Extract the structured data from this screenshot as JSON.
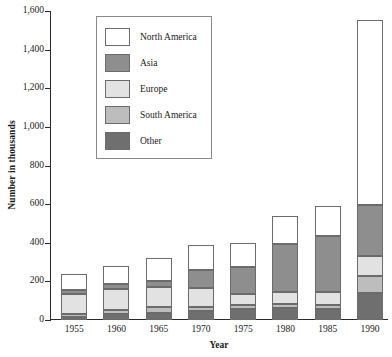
{
  "chart_data": {
    "type": "bar",
    "stacked": true,
    "title": "",
    "subtitle": "",
    "xlabel": "Year",
    "ylabel": "Number in thousands",
    "categories": [
      "1955",
      "1960",
      "1965",
      "1970",
      "1975",
      "1980",
      "1985",
      "1990"
    ],
    "ylim": [
      0,
      1600
    ],
    "yticks": [
      0,
      200,
      400,
      600,
      800,
      1000,
      1200,
      1400,
      1600
    ],
    "ytick_labels": [
      "0",
      "200",
      "400",
      "600",
      "800",
      "1,000",
      "1,200",
      "1,400",
      "1,600"
    ],
    "grid": false,
    "legend_position": "upper-left-inside",
    "stack_order_bottom_to_top": [
      "Other",
      "South America",
      "Europe",
      "Asia",
      "North America"
    ],
    "series": [
      {
        "name": "North America",
        "color": "#ffffff",
        "values": [
          85,
          95,
          120,
          130,
          125,
          145,
          155,
          960
        ]
      },
      {
        "name": "Asia",
        "color": "#8e8e8e",
        "values": [
          20,
          25,
          30,
          95,
          140,
          250,
          290,
          265
        ]
      },
      {
        "name": "Europe",
        "color": "#e2e2e2",
        "values": [
          105,
          110,
          105,
          100,
          55,
          60,
          65,
          100
        ]
      },
      {
        "name": "South America",
        "color": "#bdbdbd",
        "values": [
          15,
          20,
          30,
          20,
          25,
          25,
          25,
          90
        ]
      },
      {
        "name": "Other",
        "color": "#6f6f6f",
        "values": [
          15,
          30,
          35,
          45,
          55,
          60,
          55,
          140
        ]
      }
    ],
    "totals": [
      240,
      280,
      320,
      390,
      400,
      540,
      590,
      1555
    ]
  },
  "legend": {
    "items": [
      {
        "label": "North America",
        "color": "#ffffff"
      },
      {
        "label": "Asia",
        "color": "#8e8e8e"
      },
      {
        "label": "Europe",
        "color": "#e2e2e2"
      },
      {
        "label": "South America",
        "color": "#bdbdbd"
      },
      {
        "label": "Other",
        "color": "#6f6f6f"
      }
    ]
  }
}
